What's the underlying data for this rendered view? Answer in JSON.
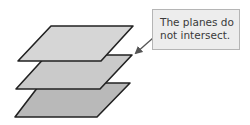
{
  "diagram": {
    "callout": {
      "lines": [
        "The planes do",
        "not intersect."
      ],
      "background": "#ededed",
      "border": "#b5b5b5"
    },
    "planes": [
      {
        "name": "top-plane",
        "fill": "#d6d6d6",
        "points": "51,26 133,26 101,61 18,61"
      },
      {
        "name": "middle-plane",
        "fill": "#cacaca",
        "points": "43,62 47,55 132,55 100,89 16,89"
      },
      {
        "name": "bottom-plane",
        "fill": "#b9b9b9",
        "points": "41,84 47,83 130,83 97,117 15,117"
      }
    ],
    "stroke": "#222222",
    "arrow": {
      "from": [
        153,
        38
      ],
      "to": [
        135,
        54
      ],
      "color": "#555555"
    }
  }
}
